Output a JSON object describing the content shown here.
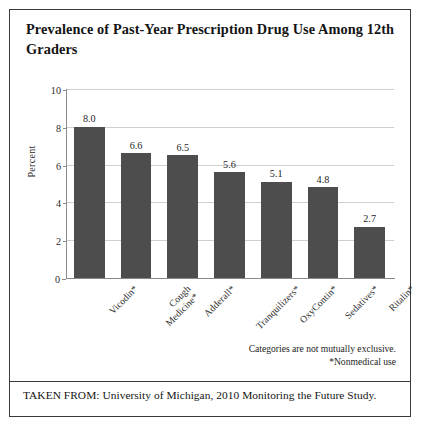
{
  "figure": {
    "title": "Prevalence of Past-Year Prescription Drug Use Among 12th Graders",
    "footnote_1": "Categories are not mutually exclusive.",
    "footnote_2": "*Nonmedical use",
    "source": "TAKEN FROM: University of Michigan, 2010 Monitoring the Future Study.",
    "bar_color": "#4d4d4d",
    "grid_color": "#cfcfcf",
    "axis_color": "#8a8a8a",
    "border_color": "#3a3a3a"
  },
  "chart_data": {
    "type": "bar",
    "title": "Prevalence of Past-Year Prescription Drug Use Among 12th Graders",
    "xlabel": "",
    "ylabel": "Percent",
    "categories": [
      "Vicodin*",
      "Cough\nMedicine*",
      "Adderall*",
      "Tranquilizers*",
      "OxyContin*",
      "Sedatives*",
      "Ritalin*"
    ],
    "values": [
      8.0,
      6.6,
      6.5,
      5.6,
      5.1,
      4.8,
      2.7
    ],
    "value_labels": [
      "8.0",
      "6.6",
      "6.5",
      "5.6",
      "5.1",
      "4.8",
      "2.7"
    ],
    "ylim": [
      0,
      10
    ],
    "yticks": [
      0,
      2,
      4,
      6,
      8,
      10
    ],
    "ytick_labels": [
      "0",
      "2",
      "4",
      "6",
      "8",
      "10"
    ],
    "grid": "horizontal",
    "legend": "none",
    "annotations": [
      "Categories are not mutually exclusive.",
      "*Nonmedical use"
    ]
  }
}
